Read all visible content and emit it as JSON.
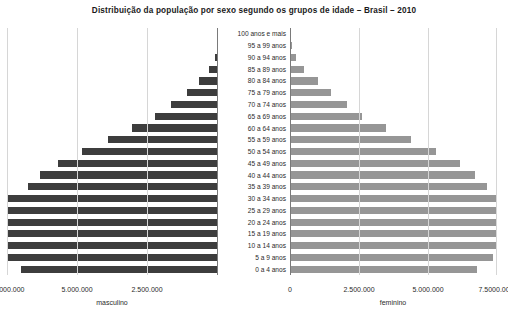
{
  "chart_data": {
    "type": "bar",
    "subtype": "population-pyramid",
    "title": "Distribuição da população por sexo segundo os grupos de idade – Brasil – 2010",
    "xlabel": "",
    "ylabel": "",
    "grid": true,
    "legend_position": "axis-captions",
    "categories": [
      "0 a 4 anos",
      "5 a 9 anos",
      "10 a 14 anos",
      "15 a 19 anos",
      "20 a 24 anos",
      "25 a 29 anos",
      "30 a 34 anos",
      "35 a 39 anos",
      "40 a 44 anos",
      "45 a 49 anos",
      "50 a 54 anos",
      "55 a 59 anos",
      "60 a 64 anos",
      "65 a 69 anos",
      "70 a 74 anos",
      "75 a 79 anos",
      "80 a 84 anos",
      "85 a 89 anos",
      "90 a 94 anos",
      "95 a 99 anos",
      "100 anos e mais"
    ],
    "series": [
      {
        "name": "masculino",
        "side": "left",
        "color": "#3d3d3d",
        "values": [
          7016987,
          7624144,
          8725413,
          8558868,
          8630229,
          8460995,
          7717420,
          6766665,
          6320568,
          5692014,
          4834995,
          3902344,
          3041034,
          2224065,
          1667372,
          1090518,
          668623,
          310759,
          114964,
          31529,
          7247
        ]
      },
      {
        "name": "feminino",
        "side": "right",
        "color": "#969696",
        "values": [
          6779171,
          7345231,
          8441348,
          8432004,
          8614963,
          8643419,
          8026854,
          7121915,
          6688797,
          6141338,
          5305407,
          4373875,
          3468085,
          2616745,
          2074264,
          1472930,
          998349,
          508724,
          211595,
          66806,
          16989
        ]
      }
    ],
    "axis_max": 7500000,
    "xticks_left": [
      "7.5000.000",
      "5.000.000",
      "2.500.000"
    ],
    "xticks_right": [
      "0",
      "2.500.000",
      "5.000.000",
      "7.5000.000"
    ],
    "caption_left": "masculino",
    "caption_right": "feminino"
  }
}
